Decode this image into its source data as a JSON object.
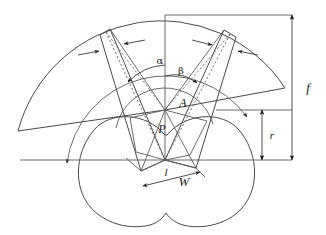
{
  "figure": {
    "background_color": "#ffffff",
    "line_color": "#4a4a4a",
    "label_color": "#1a1a1a"
  },
  "labels": {
    "alpha": "α",
    "beta": "β",
    "point_a": "A",
    "point_p": "P",
    "length_l": "l",
    "width_w": "W",
    "radius_f": "f",
    "radius_r": "r"
  },
  "annotations": [
    {
      "name": "alpha-angle",
      "symbol": "α",
      "meaning": "outer fan angle",
      "x": 160,
      "y": 62
    },
    {
      "name": "beta-angle",
      "symbol": "β",
      "meaning": "inner fan angle",
      "x": 180,
      "y": 72
    },
    {
      "name": "vertex-a",
      "symbol": "A",
      "meaning": "upper apex point",
      "x": 184,
      "y": 104
    },
    {
      "name": "vertex-p",
      "symbol": "P",
      "meaning": "pivot point",
      "x": 163,
      "y": 130
    },
    {
      "name": "segment-l",
      "symbol": "l",
      "meaning": "segment length",
      "x": 166,
      "y": 172
    },
    {
      "name": "dimension-w",
      "symbol": "W",
      "meaning": "width dimension",
      "x": 185,
      "y": 182
    },
    {
      "name": "radius-f",
      "symbol": "f",
      "meaning": "outer radius / focal distance",
      "x": 310,
      "y": 90
    },
    {
      "name": "radius-r",
      "symbol": "r",
      "meaning": "inner radius",
      "x": 272,
      "y": 137
    }
  ],
  "geometry": {
    "center_x": 165,
    "center_y": 110,
    "lower_vertex_x": 165,
    "lower_vertex_y": 160,
    "outer_radius": 148,
    "middle_radius": 100,
    "inner_radius": 50,
    "sector_start_deg": 188,
    "sector_end_deg": 352,
    "dimension_f_top": 15,
    "dimension_f_bottom": 160,
    "dimension_r_top": 110,
    "dimension_r_bottom": 160
  }
}
